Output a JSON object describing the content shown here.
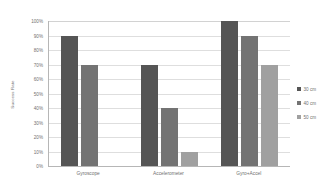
{
  "chart_data": {
    "type": "bar",
    "title": "",
    "xlabel": "",
    "ylabel": "Success Rate",
    "categories": [
      "Gyroscope",
      "Accelerometer",
      "Gyro+Accel"
    ],
    "series": [
      {
        "name": "30 cm",
        "color": "#555555",
        "values": [
          90,
          70,
          100
        ]
      },
      {
        "name": "40 cm",
        "color": "#737373",
        "values": [
          70,
          40,
          90
        ]
      },
      {
        "name": "50 cm",
        "color": "#a0a0a0",
        "values": [
          0,
          10,
          70
        ]
      }
    ],
    "ylim": [
      0,
      100
    ],
    "ytick_labels": [
      "100%",
      "90%",
      "80%",
      "70%",
      "60%",
      "50%",
      "40%",
      "30%",
      "20%",
      "10%",
      "0%"
    ],
    "ytick_values": [
      100,
      90,
      80,
      70,
      60,
      50,
      40,
      30,
      20,
      10,
      0
    ],
    "grid": true,
    "legend_position": "right",
    "value_suffix": "%"
  }
}
